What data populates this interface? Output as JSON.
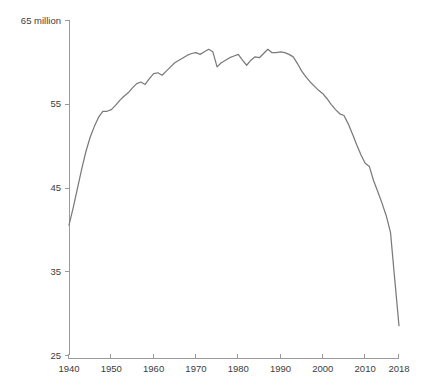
{
  "chart_data": {
    "type": "line",
    "title": "",
    "subtitle": "",
    "xlabel": "",
    "ylabel": "",
    "y_unit_label": "65 million",
    "xlim": [
      1940,
      2018
    ],
    "ylim": [
      25,
      65
    ],
    "grid": false,
    "legend": false,
    "legend_position": "none",
    "x_ticks": [
      1940,
      1950,
      1960,
      1970,
      1980,
      1990,
      2000,
      2010,
      2018
    ],
    "x_tick_labels": [
      "1940",
      "1950",
      "1960",
      "1970",
      "1980",
      "1990",
      "2000",
      "2010",
      "2018"
    ],
    "y_ticks": [
      25,
      35,
      45,
      55,
      65
    ],
    "y_tick_labels": [
      "25",
      "35",
      "45",
      "55",
      "65 million"
    ],
    "line_color": "#7a7a7a",
    "axis_color": "#9a9a9a",
    "series": [
      {
        "name": "value",
        "x": [
          1940,
          1941,
          1942,
          1943,
          1944,
          1945,
          1946,
          1947,
          1948,
          1949,
          1950,
          1951,
          1952,
          1953,
          1954,
          1955,
          1956,
          1957,
          1958,
          1959,
          1960,
          1961,
          1962,
          1963,
          1964,
          1965,
          1966,
          1967,
          1968,
          1969,
          1970,
          1971,
          1972,
          1973,
          1974,
          1975,
          1976,
          1977,
          1978,
          1979,
          1980,
          1981,
          1982,
          1983,
          1984,
          1985,
          1986,
          1987,
          1988,
          1989,
          1990,
          1991,
          1992,
          1993,
          1994,
          1995,
          1996,
          1997,
          1998,
          1999,
          2000,
          2001,
          2002,
          2003,
          2004,
          2005,
          2006,
          2007,
          2008,
          2009,
          2010,
          2011,
          2012,
          2013,
          2014,
          2015,
          2016,
          2017,
          2018
        ],
        "values": [
          40.5,
          42.6,
          44.9,
          47.2,
          49.3,
          51.0,
          52.3,
          53.4,
          54.1,
          54.1,
          54.3,
          54.8,
          55.4,
          55.9,
          56.3,
          56.9,
          57.4,
          57.6,
          57.3,
          58.0,
          58.6,
          58.7,
          58.4,
          58.9,
          59.4,
          59.9,
          60.2,
          60.5,
          60.8,
          61.0,
          61.1,
          60.9,
          61.2,
          61.5,
          61.2,
          59.4,
          59.9,
          60.2,
          60.5,
          60.7,
          60.9,
          60.2,
          59.6,
          60.2,
          60.6,
          60.5,
          61.0,
          61.5,
          61.1,
          61.1,
          61.2,
          61.1,
          60.9,
          60.6,
          59.8,
          58.9,
          58.2,
          57.6,
          57.1,
          56.6,
          56.2,
          55.6,
          54.9,
          54.3,
          53.8,
          53.6,
          52.6,
          51.4,
          50.1,
          48.9,
          47.9,
          47.5,
          45.8,
          44.5,
          43.1,
          41.6,
          39.6,
          34.0,
          28.5
        ]
      }
    ]
  }
}
